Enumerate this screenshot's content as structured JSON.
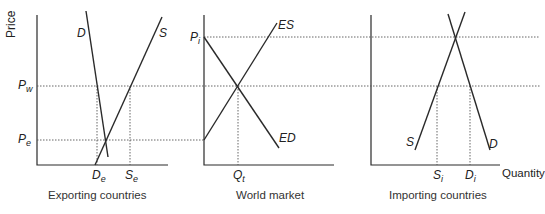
{
  "axis": {
    "y_label": "Price",
    "x_label": "Quantity"
  },
  "panels": [
    {
      "caption": "Exporting countries",
      "curves": [
        "D",
        "S"
      ],
      "x_ticks": [
        {
          "main": "D",
          "sub": "e"
        },
        {
          "main": "S",
          "sub": "e"
        }
      ]
    },
    {
      "caption": "World market",
      "curves": [
        "ES",
        "ED"
      ],
      "x_ticks": [
        {
          "main": "Q",
          "sub": "t"
        }
      ]
    },
    {
      "caption": "Importing countries",
      "curves": [
        "S",
        "D"
      ],
      "x_ticks": [
        {
          "main": "S",
          "sub": "i"
        },
        {
          "main": "D",
          "sub": "i"
        }
      ]
    }
  ],
  "price_levels": [
    {
      "main": "P",
      "sub": "i"
    },
    {
      "main": "P",
      "sub": "w"
    },
    {
      "main": "P",
      "sub": "e"
    }
  ],
  "colors": {
    "line": "#2a2a2a",
    "dotted": "#555555",
    "background": "#ffffff"
  }
}
